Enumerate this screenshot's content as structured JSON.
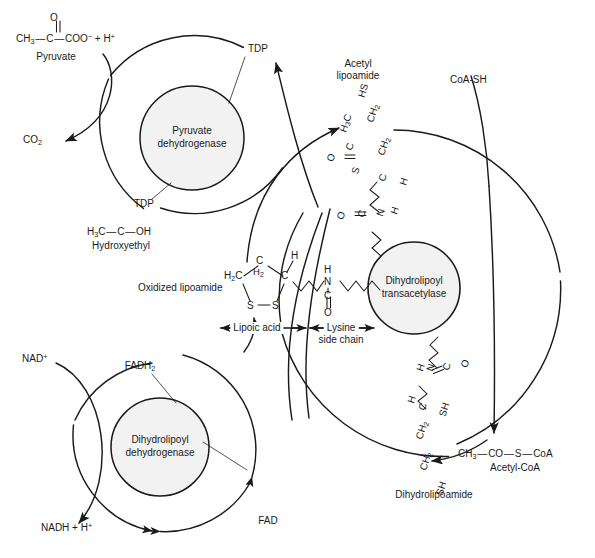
{
  "diagram": {
    "type": "biochemical-pathway",
    "background": "#ffffff",
    "stroke": "#1a1a1a",
    "enzyme_fill": "#f2f2f2"
  },
  "enzymes": [
    {
      "id": "e1",
      "line1": "Pyruvate",
      "line2": "dehydrogenase",
      "cx": 192,
      "cy": 138,
      "r": 52,
      "ring_r": 108
    },
    {
      "id": "e2",
      "line1": "Dihydrolipoyl",
      "line2": "transacetylase",
      "cx": 414,
      "cy": 288,
      "r": 46,
      "ring_r": 168
    },
    {
      "id": "e3",
      "line1": "Dihydrolipoyl",
      "line2": "dehydrogenase",
      "cx": 160,
      "cy": 447,
      "r": 49,
      "ring_r": 98
    }
  ],
  "substrates": {
    "pyruvate": {
      "name": "Pyruvate",
      "formula_top": "O",
      "formula_main": "CH3 — C — COO− + H+",
      "parts": {
        "ch3": "CH",
        "ch3_sub": "3",
        "c": "C",
        "coo": "COO",
        "coo_sup": "−",
        "plus_h": "+ H",
        "h_sup": "+"
      }
    },
    "co2": {
      "name": "CO",
      "sub": "2"
    },
    "tdp_top": {
      "name": "TDP"
    },
    "tdp_bottom": {
      "name": "TDP"
    },
    "hydroxyethyl": {
      "name": "Hydroxyethyl",
      "parts": {
        "h3c": "H",
        "h3c_sub": "3",
        "h3c_rest": "C",
        "dash1": "—",
        "c": "C",
        "dash2": "—",
        "oh": "OH"
      }
    },
    "acetyl_lipoamide": {
      "name_line1": "Acetyl",
      "name_line2": "lipoamide",
      "atoms": [
        "HS",
        "CH2",
        "CH2",
        "C",
        "H",
        "H3C",
        "C",
        "O",
        "S",
        "N",
        "H",
        "C",
        "O"
      ]
    },
    "oxidized_lipoamide": {
      "name": "Oxidized lipoamide",
      "atoms": [
        "H2C",
        "C",
        "H2",
        "C",
        "H",
        "S",
        "S",
        "N",
        "H",
        "C",
        "O"
      ],
      "bracket_left": "Lipoic acid",
      "bracket_right_line1": "Lysine",
      "bracket_right_line2": "side chain"
    },
    "dihydrolipoamide": {
      "name": "Dihydrolipoamide",
      "atoms": [
        "H",
        "N",
        "C",
        "O",
        "H",
        "C",
        "SH",
        "CH2",
        "CH2",
        "SH"
      ]
    },
    "coa_sh": {
      "name": "CoA-SH"
    },
    "acetyl_coa": {
      "name": "Acetyl-CoA",
      "formula": "CH3 — CO — S — CoA",
      "parts": {
        "ch3": "CH",
        "ch3_sub": "3",
        "co": "CO",
        "s": "S",
        "coa": "CoA"
      }
    },
    "fadh2": {
      "name": "FADH",
      "sub": "2"
    },
    "fad": {
      "name": "FAD"
    },
    "nad_plus": {
      "name": "NAD",
      "sup": "+"
    },
    "nadh": {
      "name": "NADH + H",
      "sup": "+"
    }
  },
  "annotations": {
    "lipoic_acid_bracket": "Lipoic acid",
    "lysine_bracket_1": "Lysine",
    "lysine_bracket_2": "side chain"
  }
}
